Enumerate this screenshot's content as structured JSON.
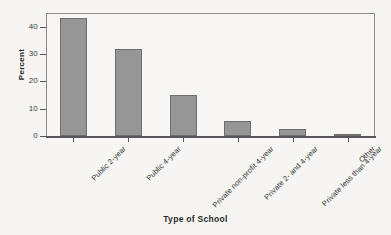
{
  "chart_data": {
    "type": "bar",
    "title": "",
    "subtitle": "",
    "categories": [
      "Public 2-year",
      "Public 4-year",
      "Private non-profit 4-year",
      "Private 2- and 4-year",
      "Private less than 4-year",
      "Other"
    ],
    "values": [
      43,
      32,
      15,
      5.5,
      2.5,
      0.8
    ],
    "xlabel": "Type of School",
    "ylabel": "Percent",
    "ylim": [
      0,
      45
    ],
    "yticks": [
      0,
      10,
      20,
      30,
      40
    ],
    "ytick_labels": [
      "0",
      "10",
      "20",
      "30",
      "40"
    ],
    "grid": false,
    "legend": false,
    "legend_position": "none",
    "annotations": [],
    "series": [
      {
        "name": "Percent",
        "values": [
          43,
          32,
          15,
          5.5,
          2.5,
          0.8
        ]
      }
    ]
  },
  "style": {
    "bar_fill": "#969696",
    "bar_border": "#6e6e6e",
    "axis_color": "#57565a",
    "frame_color": "#8e8c88",
    "background": "#f6f5f3",
    "text_color": "#2b2b2b"
  }
}
